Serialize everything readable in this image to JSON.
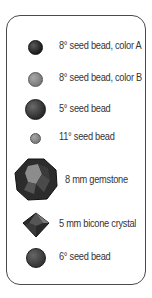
{
  "legend": {
    "items": [
      {
        "label": "8° seed bead, color A",
        "icon": "dark-round-bead-icon",
        "color": "#2b2b2b"
      },
      {
        "label": "8° seed bead, color B",
        "icon": "gray-round-bead-icon",
        "color": "#8a8a8a"
      },
      {
        "label": "5° seed bead",
        "icon": "large-dark-round-bead-icon",
        "color": "#3a3a3a"
      },
      {
        "label": "11° seed bead",
        "icon": "small-gray-round-bead-icon",
        "color": "#8c8c8c"
      },
      {
        "label": "8 mm gemstone",
        "icon": "faceted-gemstone-icon",
        "color": "#3c3c3c"
      },
      {
        "label": "5 mm bicone crystal",
        "icon": "bicone-crystal-icon",
        "color": "#2f2f2f"
      },
      {
        "label": "6° seed bead",
        "icon": "medium-dark-round-bead-icon",
        "color": "#444444"
      }
    ]
  }
}
